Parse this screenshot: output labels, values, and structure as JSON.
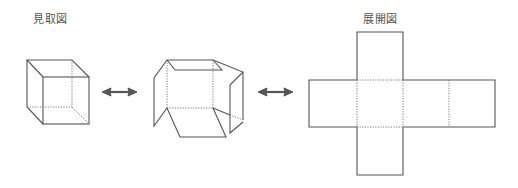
{
  "labels": {
    "perspective_view": "見取図",
    "net_view": "展開図"
  },
  "diagram": {
    "figures": [
      {
        "id": "cube-perspective",
        "description": "立方体の見取図"
      },
      {
        "id": "cube-unfolding",
        "description": "展開途中の立方体"
      },
      {
        "id": "cube-net",
        "description": "十字形の展開図"
      }
    ],
    "arrows": [
      {
        "id": "arrow-1",
        "direction": "both",
        "from": "cube-perspective",
        "to": "cube-unfolding"
      },
      {
        "id": "arrow-2",
        "direction": "both",
        "from": "cube-unfolding",
        "to": "cube-net"
      }
    ],
    "colors": {
      "line": "#555555",
      "hidden_line": "#777777",
      "background": "#ffffff"
    }
  }
}
